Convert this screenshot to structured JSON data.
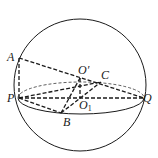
{
  "figure": {
    "type": "sphere with inscribed pyramid (geometry diagram)",
    "stroke_color": "#1a1a1a",
    "background": "#ffffff"
  },
  "labels": {
    "A": "A",
    "P": "P",
    "Q": "Q",
    "B": "B",
    "C": "C",
    "O_prime": "O′",
    "O1_base": "O",
    "O1_sub": "1"
  },
  "points": {
    "A": [
      19,
      58
    ],
    "P": [
      19,
      98
    ],
    "Q": [
      144,
      98
    ],
    "B": [
      61,
      113
    ],
    "C": [
      101,
      82
    ],
    "O_prime": [
      80,
      78
    ],
    "O1": [
      80,
      98
    ]
  },
  "sphere": {
    "cx": 80,
    "cy": 85,
    "r": 66
  },
  "equator": {
    "cx": 81,
    "cy": 98,
    "rx": 63,
    "ry": 16
  }
}
